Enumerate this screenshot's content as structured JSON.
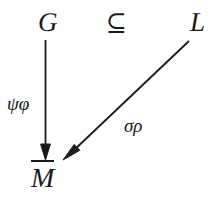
{
  "diagram": {
    "type": "commutative-diagram",
    "background_color": "#ffffff",
    "ink_color": "#1a1a1a",
    "nodes": [
      {
        "id": "G",
        "label": "G",
        "role": "source-object"
      },
      {
        "id": "L",
        "label": "L",
        "role": "source-object"
      },
      {
        "id": "Mbar",
        "label": "M",
        "accent": "overline",
        "role": "target-object"
      }
    ],
    "relations": [
      {
        "id": "subset",
        "symbol": "⊆",
        "from": "G",
        "to": "L",
        "kind": "containment"
      }
    ],
    "edges": [
      {
        "id": "G-to-Mbar",
        "label": "ψφ",
        "from": "G",
        "to": "Mbar",
        "direction": "down",
        "arrowhead": "solid-triangle"
      },
      {
        "id": "L-to-Mbar",
        "label": "σρ",
        "from": "L",
        "to": "Mbar",
        "direction": "down-left",
        "arrowhead": "solid-triangle"
      }
    ]
  }
}
